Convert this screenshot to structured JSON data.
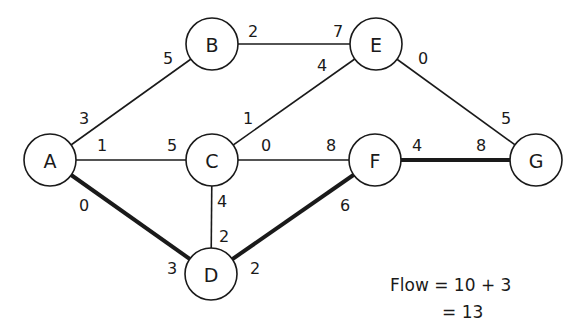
{
  "diagram": {
    "type": "network-flow",
    "nodes": [
      {
        "id": "A",
        "label": "A",
        "x": 50,
        "y": 160
      },
      {
        "id": "B",
        "label": "B",
        "x": 212,
        "y": 44
      },
      {
        "id": "C",
        "label": "C",
        "x": 212,
        "y": 160
      },
      {
        "id": "D",
        "label": "D",
        "x": 211,
        "y": 274
      },
      {
        "id": "E",
        "label": "E",
        "x": 376,
        "y": 44
      },
      {
        "id": "F",
        "label": "F",
        "x": 375,
        "y": 160
      },
      {
        "id": "G",
        "label": "G",
        "x": 536,
        "y": 160
      }
    ],
    "node_radius": 26,
    "edges": [
      {
        "from": "A",
        "to": "B",
        "bold": false,
        "labels": [
          {
            "text": "3",
            "x": 84,
            "y": 118
          },
          {
            "text": "5",
            "x": 168,
            "y": 58
          }
        ]
      },
      {
        "from": "A",
        "to": "C",
        "bold": false,
        "labels": [
          {
            "text": "1",
            "x": 102,
            "y": 145
          },
          {
            "text": "5",
            "x": 172,
            "y": 145
          }
        ]
      },
      {
        "from": "A",
        "to": "D",
        "bold": true,
        "labels": [
          {
            "text": "0",
            "x": 84,
            "y": 205
          },
          {
            "text": "3",
            "x": 172,
            "y": 268
          }
        ]
      },
      {
        "from": "B",
        "to": "E",
        "bold": false,
        "labels": [
          {
            "text": "2",
            "x": 253,
            "y": 31
          },
          {
            "text": "7",
            "x": 338,
            "y": 31
          }
        ]
      },
      {
        "from": "C",
        "to": "E",
        "bold": false,
        "labels": [
          {
            "text": "1",
            "x": 248,
            "y": 118
          },
          {
            "text": "4",
            "x": 322,
            "y": 65
          }
        ]
      },
      {
        "from": "C",
        "to": "F",
        "bold": false,
        "labels": [
          {
            "text": "0",
            "x": 266,
            "y": 145
          },
          {
            "text": "8",
            "x": 331,
            "y": 145
          }
        ]
      },
      {
        "from": "C",
        "to": "D",
        "bold": false,
        "labels": [
          {
            "text": "4",
            "x": 222,
            "y": 201
          },
          {
            "text": "2",
            "x": 224,
            "y": 236
          }
        ]
      },
      {
        "from": "D",
        "to": "F",
        "bold": true,
        "labels": [
          {
            "text": "2",
            "x": 255,
            "y": 268
          },
          {
            "text": "6",
            "x": 345,
            "y": 205
          }
        ]
      },
      {
        "from": "E",
        "to": "G",
        "bold": false,
        "labels": [
          {
            "text": "0",
            "x": 423,
            "y": 58
          },
          {
            "text": "5",
            "x": 506,
            "y": 118
          }
        ]
      },
      {
        "from": "F",
        "to": "G",
        "bold": true,
        "labels": [
          {
            "text": "4",
            "x": 417,
            "y": 145
          },
          {
            "text": "8",
            "x": 481,
            "y": 145
          }
        ]
      }
    ]
  },
  "annotation": {
    "line1": "Flow = 10 + 3",
    "line2": "= 13"
  }
}
